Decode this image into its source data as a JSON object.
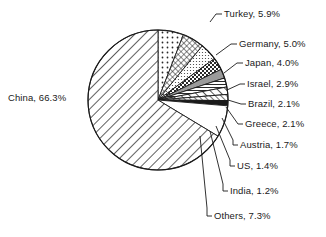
{
  "chart_data": {
    "type": "pie",
    "title": "",
    "subtitle": "",
    "xlabel": "",
    "ylabel": "",
    "legend_position": "callout-labels",
    "grid": false,
    "units": "percent",
    "start_angle_deg": 0,
    "direction": "clockwise",
    "categories": [
      "Turkey",
      "Germany",
      "Japan",
      "Israel",
      "Brazil",
      "Greece",
      "Austria",
      "US",
      "India",
      "Others",
      "China"
    ],
    "values": [
      5.9,
      5.0,
      4.0,
      2.9,
      2.1,
      2.1,
      1.7,
      1.4,
      1.2,
      7.3,
      66.3
    ],
    "slices": [
      {
        "name": "Turkey",
        "value": 5.9,
        "label": "Turkey, 5.9%",
        "pattern": "sparse-dots",
        "fill": "#ffffff"
      },
      {
        "name": "Germany",
        "value": 5.0,
        "label": "Germany, 5.0%",
        "pattern": "cross-hatch",
        "fill": "#ffffff"
      },
      {
        "name": "Japan",
        "value": 4.0,
        "label": "Japan, 4.0%",
        "pattern": "fine-stipple",
        "fill": "#ffffff"
      },
      {
        "name": "Israel",
        "value": 2.9,
        "label": "Israel, 2.9%",
        "pattern": "checkerboard",
        "fill": "#ffffff"
      },
      {
        "name": "Brazil",
        "value": 2.1,
        "label": "Brazil, 2.1%",
        "pattern": "solid-gray",
        "fill": "#9a9a9a"
      },
      {
        "name": "Greece",
        "value": 2.1,
        "label": "Greece, 2.1%",
        "pattern": "horizontal-lines",
        "fill": "#ffffff"
      },
      {
        "name": "Austria",
        "value": 1.7,
        "label": "Austria, 1.7%",
        "pattern": "diagonal-wide",
        "fill": "#ffffff"
      },
      {
        "name": "US",
        "value": 1.4,
        "label": "US, 1.4%",
        "pattern": "diagonal-narrow",
        "fill": "#ffffff"
      },
      {
        "name": "India",
        "value": 1.2,
        "label": "India, 1.2%",
        "pattern": "solid-black",
        "fill": "#1a1a1a"
      },
      {
        "name": "Others",
        "value": 7.3,
        "label": "Others, 7.3%",
        "pattern": "blank",
        "fill": "#ffffff"
      },
      {
        "name": "China",
        "value": 66.3,
        "label": "China, 66.3%",
        "pattern": "diagonal-stripes",
        "fill": "#ffffff"
      }
    ]
  },
  "labels": {
    "china": "China, 66.3%",
    "turkey": "Turkey, 5.9%",
    "germany": "Germany, 5.0%",
    "japan": "Japan, 4.0%",
    "israel": "Israel, 2.9%",
    "brazil": "Brazil, 2.1%",
    "greece": "Greece, 2.1%",
    "austria": "Austria, 1.7%",
    "us": "US, 1.4%",
    "india": "India, 1.2%",
    "others": "Others, 7.3%"
  },
  "style": {
    "stroke": "#1a1a1a",
    "background": "#ffffff",
    "text_color": "#1a1a1a"
  }
}
